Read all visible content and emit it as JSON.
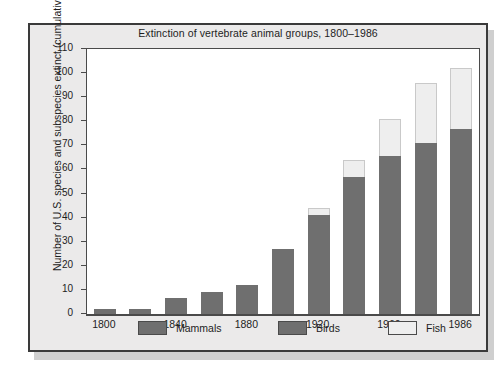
{
  "figure": {
    "title": "Extinction of vertebrate animal groups, 1800–1986",
    "ylabel": "Number of U.S. species and subspecies extinct (cumulative)",
    "xlabel": "",
    "frame_color": "#3a3a3a",
    "background_color": "#ebeaea",
    "panel_color": "#ffffff"
  },
  "legend": {
    "position": "bottom",
    "items": [
      {
        "label": "Mammals",
        "color": "#6f6f6f"
      },
      {
        "label": "Birds",
        "color": "#6f6f6f"
      },
      {
        "label": "Fish",
        "color": "#eeeeee"
      }
    ]
  },
  "chart_data": {
    "type": "bar",
    "stacked": true,
    "title": "Extinction of vertebrate animal groups, 1800–1986",
    "xlabel": "",
    "ylabel": "Number of U.S. species and subspecies extinct (cumulative)",
    "ylim": [
      0,
      110
    ],
    "yticks": [
      0,
      10,
      20,
      30,
      40,
      50,
      60,
      70,
      80,
      90,
      100,
      110
    ],
    "ytick_labels": [
      "0",
      "10",
      "20",
      "30",
      "40",
      "50",
      "60",
      "70",
      "80",
      "90",
      "100",
      "110"
    ],
    "grid": false,
    "legend_position": "bottom",
    "categories": [
      "1800",
      "1820",
      "1840",
      "1860",
      "1880",
      "1900",
      "1920",
      "1940",
      "1960",
      "1970",
      "1986"
    ],
    "xtick_labels": [
      "1800",
      "1840",
      "1880",
      "1920",
      "1960",
      "1986"
    ],
    "xtick_category_index": [
      0,
      2,
      4,
      6,
      8,
      10
    ],
    "series": [
      {
        "name": "Mammals and Birds",
        "color": "#6f6f6f",
        "values": [
          2,
          2,
          6.5,
          9,
          12,
          27,
          41,
          57,
          65.5,
          71,
          77
        ]
      },
      {
        "name": "Fish",
        "color": "#eeeeee",
        "values": [
          0,
          0,
          0,
          0,
          0,
          0,
          3,
          7,
          15.5,
          25,
          25
        ]
      }
    ],
    "totals": [
      2,
      2,
      6.5,
      9,
      12,
      27,
      44,
      64,
      81,
      96,
      102
    ]
  }
}
